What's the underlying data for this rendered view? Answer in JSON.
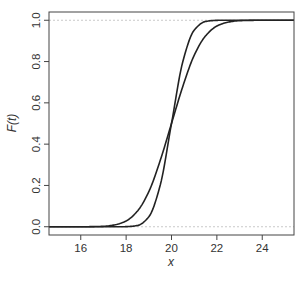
{
  "chart_data": {
    "type": "line",
    "title": "",
    "xlabel": "x",
    "ylabel": "F(t)",
    "xlim": [
      14.6,
      25.4
    ],
    "ylim": [
      -0.04,
      1.04
    ],
    "xticks": [
      16,
      18,
      20,
      22,
      24
    ],
    "yticks": [
      0.0,
      0.2,
      0.4,
      0.6,
      0.8,
      1.0
    ],
    "ytick_labels": [
      "0.0",
      "0.2",
      "0.4",
      "0.6",
      "0.8",
      "1.0"
    ],
    "xtick_labels": [
      "16",
      "18",
      "20",
      "22",
      "24"
    ],
    "grid": false,
    "reference_lines": [
      {
        "y": 0.0,
        "style": "dashed",
        "color": "#bbbbbb"
      },
      {
        "y": 1.0,
        "style": "dashed",
        "color": "#bbbbbb"
      }
    ],
    "legend": null,
    "x": [
      15,
      16,
      17,
      17.5,
      18,
      18.5,
      19,
      19.5,
      20,
      20.5,
      21,
      21.5,
      22,
      22.5,
      23,
      24,
      25
    ],
    "series": [
      {
        "name": "wide CDF",
        "color": "#222222",
        "values": [
          0.0,
          0.0,
          0.002,
          0.009,
          0.028,
          0.076,
          0.17,
          0.32,
          0.5,
          0.68,
          0.83,
          0.924,
          0.972,
          0.991,
          0.998,
          1.0,
          1.0
        ]
      },
      {
        "name": "steep CDF",
        "color": "#222222",
        "values": [
          0.0,
          0.0,
          0.0,
          0.0,
          0.0004,
          0.006,
          0.048,
          0.2,
          0.5,
          0.8,
          0.952,
          0.994,
          0.9996,
          1.0,
          1.0,
          1.0,
          1.0
        ]
      }
    ]
  },
  "axes": {
    "xlabel": "x",
    "ylabel": "F(t)"
  }
}
